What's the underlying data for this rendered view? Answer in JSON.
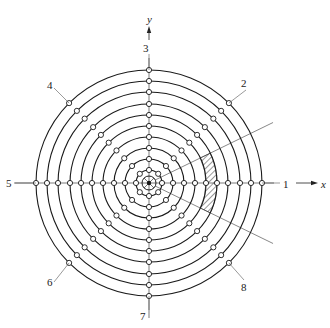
{
  "diagram": {
    "type": "concentric-ring-measurement-layout",
    "center": [
      149,
      183
    ],
    "ring_radii": [
      13,
      24,
      35,
      46,
      57,
      68,
      79,
      91,
      102,
      113
    ],
    "hub": {
      "radius": 7,
      "spokes": 8
    },
    "hole_radius": 2.6,
    "directions_deg": [
      0,
      45,
      90,
      135,
      180,
      225,
      270,
      315
    ],
    "wedge": {
      "start_deg": -26,
      "end_deg": 26,
      "line_length": 138
    },
    "hatched_sector": {
      "inner_ring_index": 4,
      "outer_ring_index": 5,
      "start_deg": -26,
      "end_deg": 26
    },
    "colors": {
      "stroke": "#1a1a1a",
      "wedge": "#555555",
      "hole_fill": "#ffffff"
    }
  },
  "labels": {
    "axis_x": "x",
    "axis_y": "y",
    "dir_1": "1",
    "dir_2": "2",
    "dir_3": "3",
    "dir_4": "4",
    "dir_5": "5",
    "dir_6": "6",
    "dir_7": "7",
    "dir_8": "8"
  }
}
